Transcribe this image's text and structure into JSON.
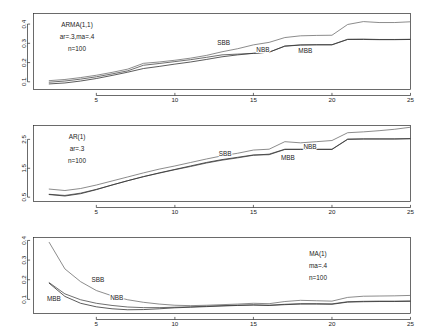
{
  "figure": {
    "title": "",
    "panel_count": 3
  },
  "chart_data": [
    {
      "type": "line",
      "title": "",
      "panel_index": 0,
      "annotation_lines": [
        "ARMA(1,1)",
        "ar=.3,ma=.4",
        "n=100"
      ],
      "xlabel": "",
      "ylabel": "",
      "xlim": [
        1,
        25
      ],
      "ylim": [
        0.06,
        0.455
      ],
      "xticks": [
        5,
        10,
        15,
        20,
        25
      ],
      "xtick_labels": [
        "5",
        "10",
        "15",
        "20",
        "25"
      ],
      "yticks": [
        0.1,
        0.2,
        0.3,
        0.4
      ],
      "ytick_labels": [
        "0.1",
        "0.2",
        "0.3",
        "0.4"
      ],
      "grid": false,
      "legend_position": "inline-annotations",
      "x": [
        2,
        3,
        4,
        5,
        6,
        7,
        8,
        9,
        10,
        11,
        12,
        13,
        14,
        15,
        16,
        17,
        18,
        19,
        20,
        21,
        22,
        23,
        24,
        25
      ],
      "series": [
        {
          "name": "SBB",
          "color": "#6e6e6e",
          "label_x": 13.1,
          "label_y": 0.289,
          "values": [
            0.106,
            0.112,
            0.122,
            0.134,
            0.149,
            0.166,
            0.196,
            0.203,
            0.212,
            0.223,
            0.237,
            0.256,
            0.272,
            0.292,
            0.305,
            0.33,
            0.339,
            0.341,
            0.342,
            0.398,
            0.413,
            0.408,
            0.408,
            0.412
          ]
        },
        {
          "name": "NBB",
          "color": "#4a4a4a",
          "label_x": 15.6,
          "label_y": 0.254,
          "values": [
            0.098,
            0.104,
            0.114,
            0.126,
            0.141,
            0.157,
            0.186,
            0.195,
            0.205,
            0.215,
            0.227,
            0.24,
            0.244,
            0.248,
            0.254,
            0.286,
            0.292,
            0.293,
            0.293,
            0.321,
            0.322,
            0.32,
            0.32,
            0.321
          ]
        },
        {
          "name": "MBB",
          "color": "#323232",
          "label_x": 18.3,
          "label_y": 0.252,
          "values": [
            0.089,
            0.094,
            0.104,
            0.117,
            0.133,
            0.15,
            0.169,
            0.18,
            0.192,
            0.203,
            0.216,
            0.23,
            0.24,
            0.248,
            0.254,
            0.285,
            0.291,
            0.292,
            0.292,
            0.32,
            0.32,
            0.319,
            0.319,
            0.32
          ]
        }
      ]
    },
    {
      "type": "line",
      "title": "",
      "panel_index": 1,
      "annotation_lines": [
        "AR(1)",
        "ar=.3",
        "n=100"
      ],
      "xlabel": "",
      "ylabel": "",
      "xlim": [
        1,
        25
      ],
      "ylim": [
        0.35,
        2.98
      ],
      "xticks": [
        5,
        10,
        15,
        20,
        25
      ],
      "xtick_labels": [
        "5",
        "10",
        "15",
        "20",
        "25"
      ],
      "yticks": [
        0.5,
        1.5,
        2.5
      ],
      "ytick_labels": [
        "0.5",
        "1.5",
        "2.5"
      ],
      "grid": false,
      "legend_position": "inline-annotations",
      "x": [
        2,
        3,
        4,
        5,
        6,
        7,
        8,
        9,
        10,
        11,
        12,
        13,
        14,
        15,
        16,
        17,
        18,
        19,
        20,
        21,
        22,
        23,
        24,
        25
      ],
      "series": [
        {
          "name": "SBB",
          "color": "#6e6e6e",
          "label_x": 13.2,
          "label_y": 1.93,
          "values": [
            0.78,
            0.73,
            0.8,
            0.92,
            1.06,
            1.2,
            1.34,
            1.47,
            1.58,
            1.7,
            1.82,
            1.93,
            2.02,
            2.13,
            2.16,
            2.42,
            2.38,
            2.42,
            2.46,
            2.73,
            2.76,
            2.8,
            2.85,
            2.92
          ]
        },
        {
          "name": "NBB",
          "color": "#4a4a4a",
          "label_x": 18.6,
          "label_y": 2.15,
          "values": [
            0.6,
            0.56,
            0.64,
            0.77,
            0.92,
            1.07,
            1.21,
            1.33,
            1.45,
            1.56,
            1.68,
            1.78,
            1.86,
            1.95,
            1.99,
            2.16,
            2.16,
            2.16,
            2.16,
            2.51,
            2.52,
            2.52,
            2.52,
            2.53
          ]
        },
        {
          "name": "MBB",
          "color": "#323232",
          "label_x": 17.2,
          "label_y": 1.78,
          "values": [
            0.59,
            0.54,
            0.62,
            0.76,
            0.92,
            1.07,
            1.21,
            1.34,
            1.46,
            1.58,
            1.7,
            1.8,
            1.88,
            1.96,
            1.97,
            2.15,
            2.15,
            2.15,
            2.15,
            2.5,
            2.51,
            2.51,
            2.51,
            2.52
          ]
        }
      ]
    },
    {
      "type": "line",
      "title": "",
      "panel_index": 2,
      "annotation_lines": [
        "MA(1)",
        "ma=.4",
        "n=100"
      ],
      "xlabel": "",
      "ylabel": "",
      "xlim": [
        1,
        25
      ],
      "ylim": [
        0.028,
        0.415
      ],
      "xticks": [
        5,
        10,
        15,
        20,
        25
      ],
      "xtick_labels": [
        "5",
        "10",
        "15",
        "20",
        "25"
      ],
      "yticks": [
        0.1,
        0.2,
        0.3,
        0.4
      ],
      "ytick_labels": [
        "0.1",
        "0.2",
        "0.3",
        "0.4"
      ],
      "grid": false,
      "legend_position": "inline-annotations",
      "x": [
        2,
        3,
        4,
        5,
        6,
        7,
        8,
        9,
        10,
        11,
        12,
        13,
        14,
        15,
        16,
        17,
        18,
        19,
        20,
        21,
        22,
        23,
        24,
        25
      ],
      "series": [
        {
          "name": "SBB",
          "color": "#6e6e6e",
          "label_x": 5.1,
          "label_y": 0.188,
          "values": [
            0.39,
            0.255,
            0.19,
            0.145,
            0.118,
            0.098,
            0.085,
            0.076,
            0.07,
            0.068,
            0.07,
            0.073,
            0.076,
            0.08,
            0.078,
            0.089,
            0.095,
            0.093,
            0.091,
            0.11,
            0.116,
            0.117,
            0.118,
            0.12
          ]
        },
        {
          "name": "NBB",
          "color": "#4a4a4a",
          "label_x": 6.3,
          "label_y": 0.098,
          "values": [
            0.185,
            0.128,
            0.098,
            0.08,
            0.069,
            0.061,
            0.058,
            0.058,
            0.06,
            0.062,
            0.065,
            0.068,
            0.07,
            0.072,
            0.07,
            0.075,
            0.078,
            0.078,
            0.077,
            0.088,
            0.09,
            0.091,
            0.091,
            0.092
          ]
        },
        {
          "name": "MBB",
          "color": "#323232",
          "label_x": 2.3,
          "label_y": 0.092,
          "values": [
            0.182,
            0.115,
            0.08,
            0.062,
            0.052,
            0.047,
            0.048,
            0.052,
            0.057,
            0.06,
            0.063,
            0.066,
            0.069,
            0.071,
            0.069,
            0.073,
            0.076,
            0.076,
            0.075,
            0.086,
            0.088,
            0.089,
            0.089,
            0.09
          ]
        }
      ]
    }
  ]
}
